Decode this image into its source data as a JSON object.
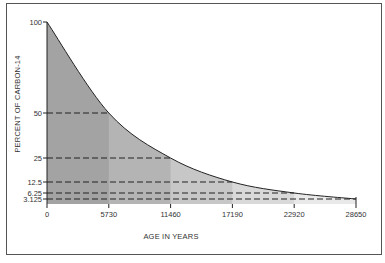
{
  "chart_data": {
    "type": "area",
    "title": "",
    "xlabel": "AGE IN YEARS",
    "ylabel": "PERCENT OF CARBON-14",
    "x": [
      0,
      5730,
      11460,
      17190,
      22920,
      28650
    ],
    "x_tick_labels": [
      "0",
      "5730",
      "11460",
      "17190",
      "22920",
      "28650"
    ],
    "y_tick_labels": [
      "100",
      "50",
      "25",
      "12.5",
      "6.25",
      "3.125"
    ],
    "series": [
      {
        "name": "Percent of Carbon-14 remaining",
        "values": [
          100,
          50,
          25,
          12.5,
          6.25,
          3.125
        ]
      }
    ],
    "half_life_years": 5730,
    "xlim": [
      0,
      28650
    ],
    "ylim": [
      0,
      100
    ],
    "grid": false,
    "legend": null,
    "annotations": "Dashed horizontal lines from y-axis to curve at each half-life level; area under curve shaded in progressively lighter bands per half-life interval",
    "band_colors": [
      "#a3a3a3",
      "#b4b4b4",
      "#c7c7c7",
      "#d9d9d9",
      "#e9e9e9"
    ]
  }
}
